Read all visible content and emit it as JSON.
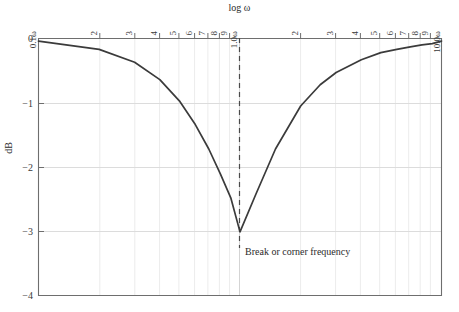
{
  "chart_data": {
    "type": "line",
    "title": "log ω",
    "xlabel": "log ω",
    "ylabel": "dB",
    "ylim": [
      -4,
      0
    ],
    "yticks": [
      0,
      -1,
      -2,
      -3,
      -4
    ],
    "ytick_labels": [
      "0",
      "−1",
      "−2",
      "−3",
      "−4"
    ],
    "xlim_labels": [
      "0.1ω",
      "10.0ω"
    ],
    "x_left_label": "0.1ω",
    "x_center_label": "1.0ω",
    "x_right_label": "10.0ω",
    "x_minor_tick_labels": [
      "2",
      "3",
      "4",
      "5",
      "6",
      "7",
      "8",
      "9"
    ],
    "decades": 2,
    "grid": true,
    "legend": "none",
    "annotations": [
      {
        "text": "Break or corner frequency",
        "x": "1.0ω",
        "y": -3.0
      }
    ],
    "marker_line": {
      "type": "vertical-dashed",
      "x": "1.0ω",
      "label": "Break or corner frequency"
    },
    "series": [
      {
        "name": "Magnitude response",
        "x": [
          0.1,
          0.2,
          0.3,
          0.4,
          0.5,
          0.6,
          0.7,
          0.8,
          0.9,
          1.0,
          1.2,
          1.5,
          2.0,
          2.5,
          3.0,
          4.0,
          5.0,
          6.0,
          7.0,
          8.0,
          9.0,
          10.0
        ],
        "y": [
          -0.04,
          -0.17,
          -0.37,
          -0.64,
          -0.97,
          -1.34,
          -1.72,
          -2.11,
          -2.48,
          -3.01,
          -2.42,
          -1.72,
          -1.05,
          -0.72,
          -0.53,
          -0.33,
          -0.22,
          -0.17,
          -0.13,
          -0.1,
          -0.08,
          -0.04
        ],
        "min_value": -3.0,
        "min_x": "1.0ω",
        "color": "#3b3b3b"
      }
    ],
    "colors": {
      "curve": "#3b3b3b",
      "frame": "#6e6e6e",
      "grid_major": "#d9d9d9",
      "grid_minor": "#ececec",
      "dashed_marker": "#4a4a4a",
      "text": "#2b2b2b",
      "background": "#ffffff"
    }
  }
}
